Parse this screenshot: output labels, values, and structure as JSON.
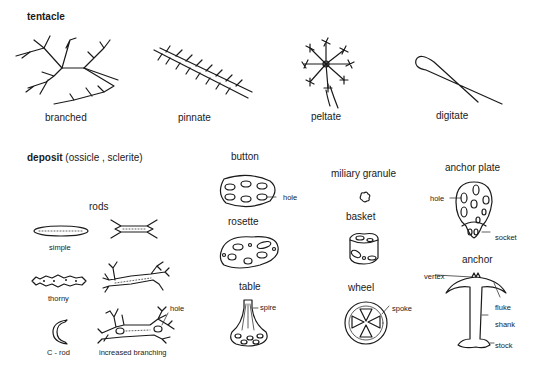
{
  "sections": {
    "tentacle": {
      "title": "tentacle",
      "types": [
        {
          "label": "branched"
        },
        {
          "label": "pinnate"
        },
        {
          "label": "peltate"
        },
        {
          "label": "digitate"
        }
      ]
    },
    "deposit": {
      "title": "deposit",
      "subtitle": "(ossicle , sclerite)",
      "rods": {
        "title": "rods",
        "items": [
          {
            "label": "simple"
          },
          {
            "label": "thorny"
          },
          {
            "label": "C - rod"
          },
          {
            "label": "increased branching",
            "annotation": "hole"
          }
        ]
      },
      "button": {
        "title": "button",
        "annotation": "hole"
      },
      "rosette": {
        "title": "rosette"
      },
      "table": {
        "title": "table",
        "annotation": "spire"
      },
      "miliary_granule": {
        "title": "miliary granule"
      },
      "basket": {
        "title": "basket"
      },
      "wheel": {
        "title": "wheel",
        "annotation": "spoke"
      },
      "anchor_plate": {
        "title": "anchor plate",
        "annotations": [
          "hole",
          "socket"
        ]
      },
      "anchor": {
        "title": "anchor",
        "annotations": [
          "vertex",
          "fluke",
          "shank",
          "stock"
        ]
      }
    }
  }
}
